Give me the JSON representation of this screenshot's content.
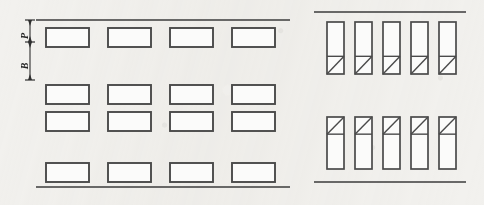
{
  "figure": {
    "type": "engineering-line-diagram",
    "background_color": "#f2f1ee",
    "line_color": "#4a4a4a",
    "rule_color": "#3b3b3b",
    "width": 484,
    "height": 205
  },
  "dimensions": {
    "labels": [
      {
        "id": "P",
        "text": "P",
        "meaning": "upper-spacing-dimension",
        "orientation": "rotated-90",
        "x": 22,
        "y": 31
      },
      {
        "id": "B",
        "text": "B",
        "meaning": "lower-spacing-dimension",
        "orientation": "rotated-90",
        "x": 22,
        "y": 61
      }
    ],
    "line_x": 30,
    "ticks_y": [
      20,
      42,
      80
    ]
  },
  "left_panel": {
    "name": "plan-view-horizontal-openings",
    "rules": [
      {
        "id": "top-rule",
        "x1": 36,
        "y": 20,
        "x2": 290
      },
      {
        "id": "bottom-rule",
        "x1": 36,
        "y": 187,
        "x2": 290
      }
    ],
    "box": {
      "width": 43,
      "height": 19
    },
    "columns_x": [
      46,
      108,
      170,
      232
    ],
    "rows_y": [
      28,
      85,
      112,
      163
    ],
    "row_count": 4,
    "column_count": 4,
    "total_boxes": 16
  },
  "right_panel": {
    "name": "elevation-view-vertical-openings",
    "rules": [
      {
        "id": "top-rule",
        "x1": 314,
        "y": 12,
        "x2": 466
      },
      {
        "id": "bottom-rule",
        "x1": 314,
        "y": 182,
        "x2": 466
      }
    ],
    "box": {
      "width": 17,
      "height": 52
    },
    "columns_x": [
      327,
      355,
      383,
      411,
      439
    ],
    "groups": [
      {
        "id": "upper-group",
        "y": 22,
        "split": "bottom",
        "split_fraction": 0.66,
        "diagonal": "bottom-left-to-top-right",
        "count": 5
      },
      {
        "id": "lower-group",
        "y": 117,
        "split": "top",
        "split_fraction": 0.33,
        "diagonal": "bottom-left-to-top-right",
        "count": 5
      }
    ]
  }
}
